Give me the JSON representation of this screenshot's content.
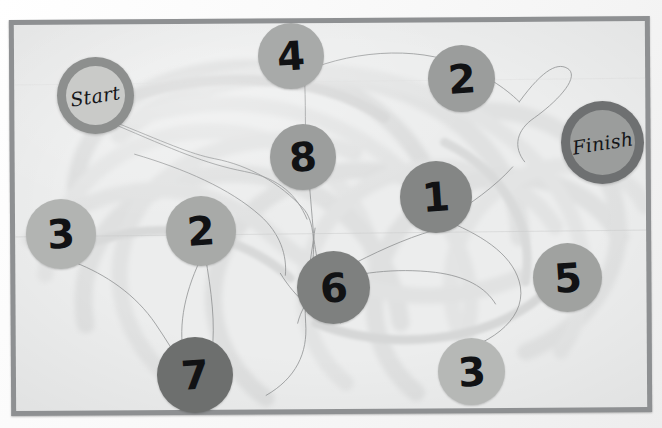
{
  "scene": {
    "kind": "board-game-photo",
    "description": "Grayscale photo of a maze board game with numbered tokens",
    "background_color": "#f4f4f4",
    "board_fill": "#eceded",
    "board_frame_color": "#8e9092",
    "ink_color": "#111214"
  },
  "endpoints": [
    {
      "id": "start",
      "label": "Start",
      "x": 57,
      "y": 57,
      "size": 77,
      "ring_color": "#8d8f8e",
      "core_color": "#c9cac8",
      "ring_width": 9
    },
    {
      "id": "finish",
      "label": "Finish",
      "x": 561,
      "y": 101,
      "size": 83,
      "ring_color": "#6e7071",
      "core_color": "#9b9d9c",
      "ring_width": 9
    }
  ],
  "tokens": [
    {
      "id": "t4",
      "label": "4",
      "x": 258,
      "y": 23,
      "size": 66,
      "color": "#a8aaa9"
    },
    {
      "id": "t2a",
      "label": "2",
      "x": 428,
      "y": 45,
      "size": 67,
      "color": "#9b9d9c"
    },
    {
      "id": "t8",
      "label": "8",
      "x": 270,
      "y": 124,
      "size": 66,
      "color": "#9c9e9d"
    },
    {
      "id": "t1",
      "label": "1",
      "x": 400,
      "y": 161,
      "size": 72,
      "color": "#848685"
    },
    {
      "id": "t3a",
      "label": "3",
      "x": 26,
      "y": 199,
      "size": 70,
      "color": "#b2b4b2"
    },
    {
      "id": "t2b",
      "label": "2",
      "x": 166,
      "y": 196,
      "size": 70,
      "color": "#a8aaa8"
    },
    {
      "id": "t6",
      "label": "6",
      "x": 297,
      "y": 251,
      "size": 73,
      "color": "#7e807f"
    },
    {
      "id": "t5",
      "label": "5",
      "x": 533,
      "y": 243,
      "size": 69,
      "color": "#a0a2a0"
    },
    {
      "id": "t7",
      "label": "7",
      "x": 157,
      "y": 337,
      "size": 76,
      "color": "#6d6f6e"
    },
    {
      "id": "t3b",
      "label": "3",
      "x": 438,
      "y": 338,
      "size": 67,
      "color": "#b6b8b6"
    }
  ],
  "paths": {
    "band_color": "#e2e3e3",
    "band_color_dark": "#d7d8d8",
    "thread_color": "#7d7f80",
    "band_count": 9,
    "thread_count": 10
  }
}
